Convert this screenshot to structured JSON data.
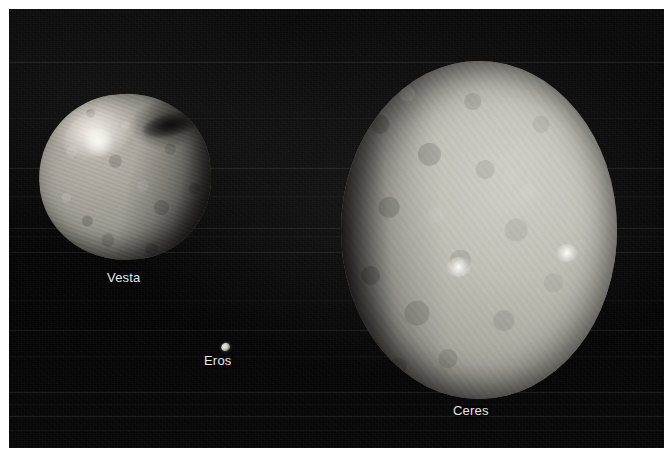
{
  "figure": {
    "kind": "astronomical-photo-composite",
    "background_color": "#070707",
    "frame_color": "#ffffff",
    "label_color": "#e8e8e8"
  },
  "bodies": [
    {
      "id": "vesta",
      "label": "Vesta",
      "surface_color": "#9d9a92",
      "highlight_color": "#d9d5cd",
      "shadow_color": "#201f1c"
    },
    {
      "id": "eros",
      "label": "Eros",
      "surface_color": "#c9c6bf",
      "highlight_color": "#efece6",
      "shadow_color": "#2a2927"
    },
    {
      "id": "ceres",
      "label": "Ceres",
      "surface_color": "#c3c0b8",
      "highlight_color": "#d2cfc8",
      "shadow_color": "#1a1917",
      "bright_spots": 2
    }
  ],
  "labels": {
    "vesta": "Vesta",
    "eros": "Eros",
    "ceres": "Ceres"
  },
  "scanline_bands": [
    62,
    118,
    168,
    196,
    228,
    236,
    252,
    300,
    330,
    356,
    392,
    404,
    416,
    430
  ]
}
